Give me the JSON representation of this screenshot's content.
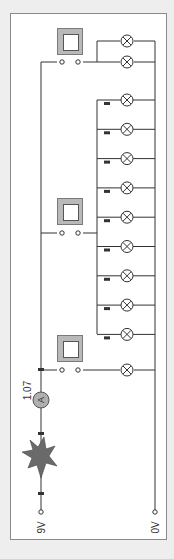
{
  "diagram": {
    "type": "circuit",
    "supply": {
      "positive_label": "9V",
      "negative_label": "0V"
    },
    "ammeter": {
      "symbol": "A",
      "reading": "1.07"
    },
    "fuse_or_spark": {
      "kind": "blown-component-starburst"
    },
    "switches": [
      {
        "id": "switch-top",
        "state": "open"
      },
      {
        "id": "switch-middle",
        "state": "open"
      },
      {
        "id": "switch-bottom",
        "state": "open"
      }
    ],
    "lamp_groups": [
      {
        "switch": "switch-top",
        "lamp_count": 2
      },
      {
        "switch": "switch-middle",
        "lamp_count": 9
      },
      {
        "switch": "switch-bottom",
        "lamp_count": 1
      }
    ],
    "colors": {
      "wire": "#333333",
      "panel": "#ffffff",
      "background": "#eeeeee",
      "switch_box": "#b9b9b9",
      "starburst": "#6a6a6a",
      "ammeter": "#b0b0b0"
    }
  }
}
